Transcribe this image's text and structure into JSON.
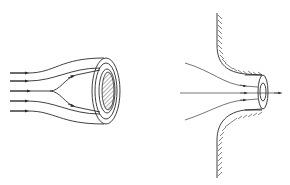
{
  "figure": {
    "panels": [
      {
        "id": "left",
        "description": "Parallel flow lines with arrows converging around a ring-shaped body with hatched core",
        "flow_line_count": 5
      },
      {
        "id": "right",
        "description": "Flow lines converging through a tube-shaped opening in a hatched curved wall",
        "flow_line_count": 3
      }
    ],
    "colors": {
      "line": "#2a2a2a",
      "background": "#ffffff"
    }
  }
}
